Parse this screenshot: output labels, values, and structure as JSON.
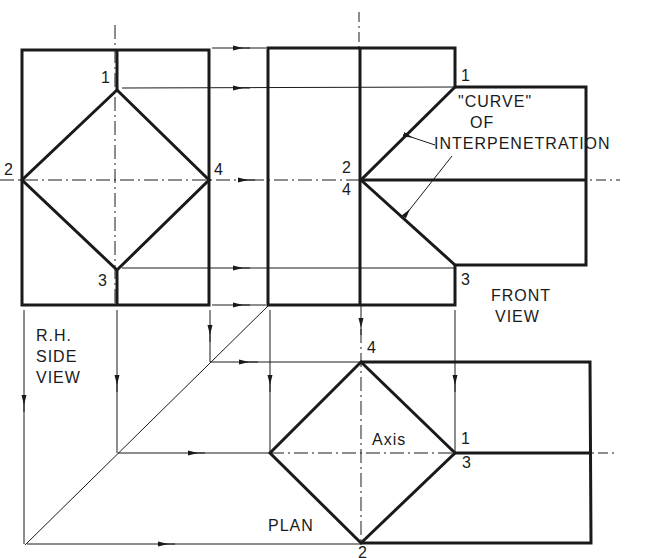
{
  "diagram": {
    "type": "orthographic projection - interpenetration of square prisms",
    "colors": {
      "line": "#1a1a1a",
      "background": "#ffffff"
    },
    "views": {
      "side": {
        "title_lines": [
          "R.H.",
          "SIDE",
          "VIEW"
        ],
        "points": {
          "p1": "1",
          "p2": "2",
          "p3": "3",
          "p4": "4"
        }
      },
      "front": {
        "title_lines": [
          "FRONT",
          "VIEW"
        ],
        "points": {
          "p1": "1",
          "p24_top": "2",
          "p24_bottom": "4",
          "p3": "3"
        }
      },
      "plan": {
        "title": "PLAN",
        "axis_label": "Axis",
        "points": {
          "p4": "4",
          "p1": "1",
          "p3": "3",
          "p2": "2"
        }
      }
    },
    "annotation": {
      "lines": [
        "\"CURVE\"",
        "OF",
        "INTERPENETRATION"
      ]
    }
  }
}
